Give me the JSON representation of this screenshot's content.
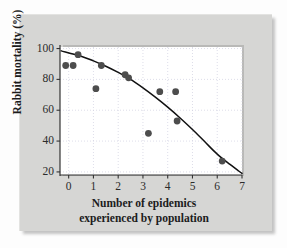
{
  "figure": {
    "panel_color": "#d6d6d4",
    "plot_bg": "#ffffff",
    "point_color": "#4d4d4d",
    "curve_color": "#111111",
    "grid_color": "#cfcfe0"
  },
  "axes": {
    "y_title": "Rabbit mortality (%)",
    "x_title_line1": "Number of epidemics",
    "x_title_line2": "experienced by population",
    "y_ticks": [
      "20",
      "40",
      "60",
      "80",
      "100"
    ],
    "x_ticks": [
      "0",
      "1",
      "2",
      "3",
      "4",
      "5",
      "6",
      "7"
    ]
  },
  "chart_data": {
    "type": "scatter",
    "title": "",
    "xlabel": "Number of epidemics experienced by population",
    "ylabel": "Rabbit mortality (%)",
    "xlim": [
      -0.35,
      7.0
    ],
    "ylim": [
      18,
      101
    ],
    "xticks": [
      0,
      1,
      2,
      3,
      4,
      5,
      6,
      7
    ],
    "yticks": [
      20,
      40,
      60,
      80,
      100
    ],
    "grid": true,
    "grid_style": "dotted",
    "legend": false,
    "series": [
      {
        "name": "Rabbit mortality observations",
        "marker": "filled-circle",
        "color": "#4d4d4d",
        "points": [
          {
            "x": -0.12,
            "y": 89
          },
          {
            "x": 0.18,
            "y": 89
          },
          {
            "x": 0.38,
            "y": 96
          },
          {
            "x": 1.1,
            "y": 74
          },
          {
            "x": 1.32,
            "y": 89
          },
          {
            "x": 2.28,
            "y": 83
          },
          {
            "x": 2.42,
            "y": 81
          },
          {
            "x": 3.22,
            "y": 45
          },
          {
            "x": 3.68,
            "y": 72
          },
          {
            "x": 4.32,
            "y": 72
          },
          {
            "x": 4.38,
            "y": 53
          },
          {
            "x": 6.2,
            "y": 27
          }
        ]
      }
    ],
    "fit_curve": {
      "name": "fitted trend line",
      "color": "#111111",
      "points": [
        {
          "x": -0.3,
          "y": 98.5
        },
        {
          "x": 0.5,
          "y": 95.0
        },
        {
          "x": 1.0,
          "y": 92.0
        },
        {
          "x": 1.5,
          "y": 88.5
        },
        {
          "x": 2.0,
          "y": 84.5
        },
        {
          "x": 2.5,
          "y": 80.0
        },
        {
          "x": 3.0,
          "y": 74.5
        },
        {
          "x": 3.5,
          "y": 68.5
        },
        {
          "x": 4.0,
          "y": 62.0
        },
        {
          "x": 4.5,
          "y": 55.0
        },
        {
          "x": 5.0,
          "y": 47.5
        },
        {
          "x": 5.5,
          "y": 39.5
        },
        {
          "x": 6.0,
          "y": 31.5
        },
        {
          "x": 6.5,
          "y": 25.0
        },
        {
          "x": 7.0,
          "y": 19.0
        }
      ]
    }
  }
}
